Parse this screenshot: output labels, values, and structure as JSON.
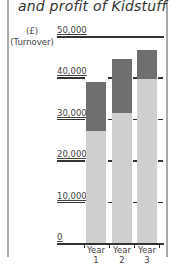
{
  "chart_data": {
    "type": "bar",
    "stacked": true,
    "title": "and profit of Kidstuff",
    "ylabel": "(£) (Turnover)",
    "xlabel": "",
    "categories": [
      "Year 1",
      "Year 2",
      "Year 3"
    ],
    "series": [
      {
        "name": "Costs",
        "color": "#cfcfcf",
        "values": [
          27000,
          31500,
          39500
        ]
      },
      {
        "name": "Profit",
        "color": "#6f6f6f",
        "values": [
          12000,
          13000,
          7000
        ]
      }
    ],
    "totals": [
      39000,
      44500,
      46500
    ],
    "yticks": [
      "0",
      "10,000",
      "20,000",
      "30,000",
      "40,000",
      "50,000"
    ],
    "ylim": [
      0,
      50000
    ],
    "grid": true,
    "legend": "none"
  },
  "labels": {
    "title": "and profit of Kidstuff",
    "ylabel_line1": "(£)",
    "ylabel_line2": "(Turnover)",
    "yticks": [
      "0",
      "10,000",
      "20,000",
      "30,000",
      "40,000",
      "50,000"
    ],
    "xticks": [
      "Year 1",
      "Year 2",
      "Year 3"
    ]
  }
}
